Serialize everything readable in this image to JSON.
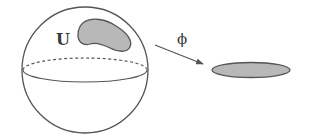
{
  "diagram": {
    "labels": {
      "region": "U",
      "map": "ϕ"
    },
    "colors": {
      "stroke": "#555555",
      "fill_region": "#b8b8b8",
      "background": "#ffffff"
    },
    "sphere": {
      "cx": 85,
      "cy": 70,
      "r": 63
    },
    "equator": {
      "cx": 85,
      "cy": 70,
      "rx": 62,
      "ry": 12
    },
    "region_U": {
      "bbox": [
        78,
        20,
        131,
        51
      ]
    },
    "arrow": {
      "from": [
        155,
        45
      ],
      "to": [
        203,
        64
      ]
    },
    "target_ellipse": {
      "cx": 251,
      "cy": 70,
      "rx": 39,
      "ry": 7.5
    }
  }
}
